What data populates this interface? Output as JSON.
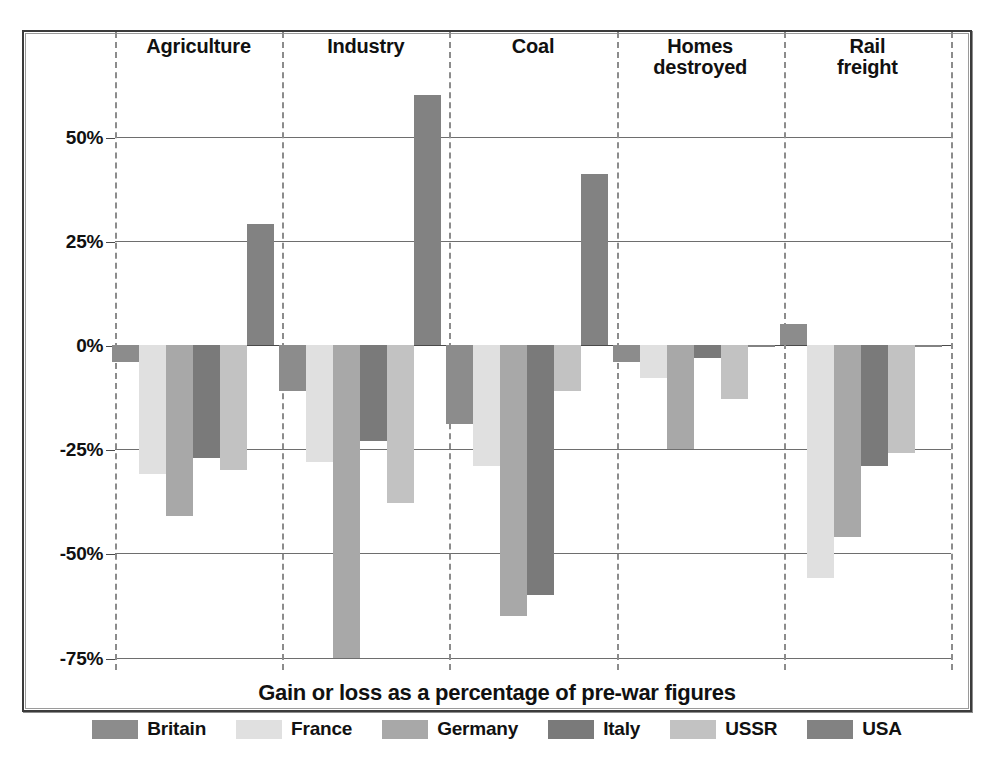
{
  "caption": "Gain or loss as a percentage of pre-war figures",
  "legend": {
    "position": "bottom",
    "entries": [
      {
        "label": "Britain",
        "color": "#8c8c8c"
      },
      {
        "label": "France",
        "color": "#e0e0e0"
      },
      {
        "label": "Germany",
        "color": "#a8a8a8"
      },
      {
        "label": "Italy",
        "color": "#7a7a7a"
      },
      {
        "label": "USSR",
        "color": "#c2c2c2"
      },
      {
        "label": "USA",
        "color": "#828282"
      }
    ]
  },
  "axis": {
    "ticks": [
      "50%",
      "25%",
      "0%",
      "-25%",
      "-50%",
      "-75%"
    ],
    "tick_values": [
      50,
      25,
      0,
      -25,
      -50,
      -75
    ],
    "ylim": [
      -78,
      68
    ],
    "grid": true
  },
  "chart_data": {
    "type": "bar",
    "title": "",
    "subtitle": "",
    "xlabel": "",
    "ylabel": "",
    "caption": "Gain or loss as a percentage of pre-war figures",
    "unit": "%",
    "grid": true,
    "legend_position": "bottom",
    "ylim": [
      -78,
      68
    ],
    "yticks": [
      50,
      25,
      0,
      -25,
      -50,
      -75
    ],
    "ytick_labels": [
      "50%",
      "25%",
      "0%",
      "-25%",
      "-50%",
      "-75%"
    ],
    "categories": [
      "Agriculture",
      "Industry",
      "Coal",
      "Homes destroyed",
      "Rail freight"
    ],
    "series": [
      {
        "name": "Britain",
        "color": "#8c8c8c",
        "values": [
          -4,
          -11,
          -19,
          -4,
          5
        ]
      },
      {
        "name": "France",
        "color": "#e0e0e0",
        "values": [
          -31,
          -28,
          -29,
          -8,
          -56
        ]
      },
      {
        "name": "Germany",
        "color": "#a8a8a8",
        "values": [
          -41,
          -75,
          -65,
          -25,
          -46
        ]
      },
      {
        "name": "Italy",
        "color": "#7a7a7a",
        "values": [
          -27,
          -23,
          -60,
          -3,
          -29
        ]
      },
      {
        "name": "USSR",
        "color": "#c2c2c2",
        "values": [
          -30,
          -38,
          -11,
          -13,
          -26
        ]
      },
      {
        "name": "USA",
        "color": "#828282",
        "values": [
          29,
          60,
          41,
          0,
          0
        ]
      }
    ]
  }
}
